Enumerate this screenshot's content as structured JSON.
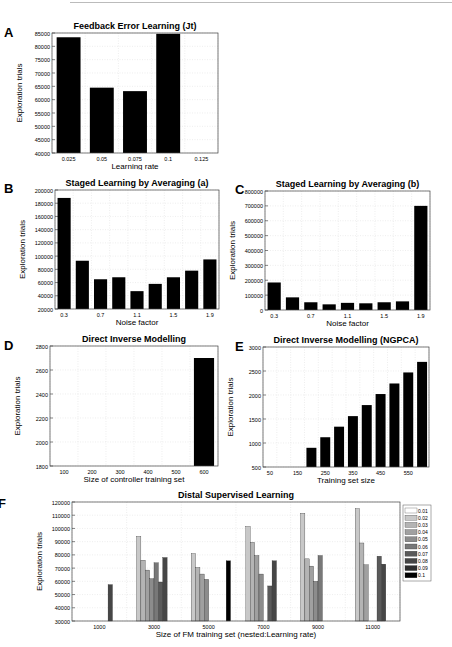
{
  "figure": {
    "panels": [
      "A",
      "B",
      "C",
      "D",
      "E",
      "F"
    ]
  },
  "chart_data": [
    {
      "id": "A",
      "type": "bar",
      "title": "Feedback Error Learning (Jt)",
      "xlabel": "Learning rate",
      "ylabel": "Exploration trials",
      "categories": [
        "0.025",
        "0.05",
        "0.075",
        "0.1",
        "0.125"
      ],
      "values": [
        83400,
        64500,
        63200,
        84700,
        null
      ],
      "xticks": [
        "0.025",
        "0.05",
        "0.075",
        "0.1",
        "0.125"
      ],
      "yticks": [
        40000,
        45000,
        50000,
        55000,
        60000,
        65000,
        70000,
        75000,
        80000,
        85000
      ],
      "ylim": [
        40000,
        85000
      ],
      "grid": true
    },
    {
      "id": "B",
      "type": "bar",
      "title": "Staged Learning by Averaging (a)",
      "xlabel": "Noise factor",
      "ylabel": "Exploration trials",
      "categories": [
        "0.3",
        "0.5",
        "0.7",
        "0.9",
        "1.1",
        "1.3",
        "1.5",
        "1.7",
        "1.9"
      ],
      "values": [
        188000,
        93000,
        65000,
        68000,
        47000,
        58000,
        68000,
        78000,
        95000
      ],
      "xticks": [
        "0.3",
        "0.7",
        "1.1",
        "1.5",
        "1.9"
      ],
      "yticks": [
        20000,
        40000,
        60000,
        80000,
        100000,
        120000,
        140000,
        160000,
        180000,
        200000
      ],
      "ylim": [
        20000,
        200000
      ],
      "grid": true
    },
    {
      "id": "C",
      "type": "bar",
      "title": "Staged Learning by Averaging (b)",
      "xlabel": "Noise factor",
      "ylabel": "Exploration trials",
      "categories": [
        "0.3",
        "0.5",
        "0.7",
        "0.9",
        "1.1",
        "1.3",
        "1.5",
        "1.7",
        "1.9"
      ],
      "values": [
        185000,
        85000,
        52000,
        38000,
        48000,
        45000,
        52000,
        58000,
        700000
      ],
      "xticks": [
        "0.3",
        "0.7",
        "1.1",
        "1.5",
        "1.9"
      ],
      "yticks": [
        0,
        100000,
        200000,
        300000,
        400000,
        500000,
        600000,
        700000,
        800000
      ],
      "ylim": [
        0,
        800000
      ],
      "grid": true
    },
    {
      "id": "D",
      "type": "bar",
      "title": "Direct Inverse Modelling",
      "xlabel": "Size of controller training set",
      "ylabel": "Exploration trials",
      "categories": [
        "100",
        "200",
        "300",
        "400",
        "500",
        "600"
      ],
      "values": [
        null,
        null,
        null,
        null,
        null,
        2700
      ],
      "xticks": [
        "100",
        "200",
        "300",
        "400",
        "500",
        "600"
      ],
      "yticks": [
        1800,
        2000,
        2200,
        2400,
        2600,
        2800
      ],
      "ylim": [
        1800,
        2800
      ],
      "grid": true
    },
    {
      "id": "E",
      "type": "bar",
      "title": "Direct Inverse Modelling (NGPCA)",
      "xlabel": "Training set size",
      "ylabel": "Exploration trials",
      "categories": [
        "50",
        "100",
        "150",
        "200",
        "250",
        "300",
        "350",
        "400",
        "450",
        "500",
        "550",
        "600"
      ],
      "values": [
        null,
        null,
        null,
        900,
        1120,
        1340,
        1560,
        1790,
        2020,
        2240,
        2470,
        2690
      ],
      "xticks": [
        "50",
        "150",
        "250",
        "350",
        "450",
        "550"
      ],
      "yticks": [
        500,
        1000,
        1500,
        2000,
        2500,
        3000
      ],
      "ylim": [
        500,
        3000
      ],
      "grid": true
    },
    {
      "id": "F",
      "type": "bar",
      "title": "Distal Supervised Learning",
      "xlabel": "Size of FM training set (nested:Learning rate)",
      "ylabel": "Exploration trials",
      "categories": [
        "1000",
        "3000",
        "5000",
        "7000",
        "9000",
        "11000"
      ],
      "legend": [
        "0.01",
        "0.02",
        "0.03",
        "0.04",
        "0.05",
        "0.06",
        "0.07",
        "0.08",
        "0.09",
        "0.1"
      ],
      "legend_colors": [
        "#ffffff",
        "#c8c8c8",
        "#b4b4b4",
        "#a0a0a0",
        "#8c8c8c",
        "#787878",
        "#5a5a5a",
        "#464646",
        "#2e2e2e",
        "#000000"
      ],
      "legend_position": "right",
      "series": [
        {
          "name": "0.01",
          "values": [
            null,
            null,
            null,
            null,
            null,
            null
          ]
        },
        {
          "name": "0.02",
          "values": [
            null,
            94000,
            81000,
            101500,
            111500,
            115000
          ]
        },
        {
          "name": "0.03",
          "values": [
            null,
            76000,
            70500,
            89500,
            77000,
            89000
          ]
        },
        {
          "name": "0.04",
          "values": [
            null,
            68500,
            65500,
            79500,
            71500,
            72500
          ]
        },
        {
          "name": "0.05",
          "values": [
            null,
            62000,
            61500,
            65500,
            60000,
            null
          ]
        },
        {
          "name": "0.06",
          "values": [
            null,
            74000,
            null,
            null,
            79500,
            null
          ]
        },
        {
          "name": "0.07",
          "values": [
            null,
            59500,
            null,
            56500,
            null,
            79000
          ]
        },
        {
          "name": "0.08",
          "values": [
            57500,
            78000,
            null,
            75500,
            null,
            73000
          ]
        },
        {
          "name": "0.09",
          "values": [
            null,
            null,
            null,
            null,
            null,
            null
          ]
        },
        {
          "name": "0.1",
          "values": [
            null,
            null,
            75500,
            null,
            null,
            null
          ]
        }
      ],
      "yticks": [
        30000,
        40000,
        50000,
        60000,
        70000,
        80000,
        90000,
        100000,
        110000,
        120000
      ],
      "ylim": [
        30000,
        120000
      ],
      "grid": true
    }
  ]
}
